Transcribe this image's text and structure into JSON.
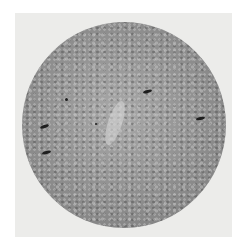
{
  "image": {
    "subject": "sunspot-photograph-solar-disk",
    "colors": {
      "background": "#ffffff",
      "frame": "#ececea",
      "disk_light": "#a9a9a9",
      "disk_dark": "#7a7a7a",
      "spot": "#1e1e1e"
    },
    "spots": [
      {
        "name": "spot-upper-center",
        "x": 147,
        "y": 91,
        "w": 9,
        "h": 3,
        "rot": -15
      },
      {
        "name": "spot-right",
        "x": 200,
        "y": 118,
        "w": 9,
        "h": 3,
        "rot": -12
      },
      {
        "name": "spot-left-upper",
        "x": 44,
        "y": 126,
        "w": 9,
        "h": 3,
        "rot": -20
      },
      {
        "name": "spot-left-lower",
        "x": 46,
        "y": 152,
        "w": 9,
        "h": 3,
        "rot": -15
      },
      {
        "name": "spot-dot-1",
        "x": 66,
        "y": 99,
        "w": 3,
        "h": 3,
        "rot": 0
      },
      {
        "name": "spot-dot-2",
        "x": 96,
        "y": 124,
        "w": 2,
        "h": 2,
        "rot": 0
      }
    ]
  }
}
